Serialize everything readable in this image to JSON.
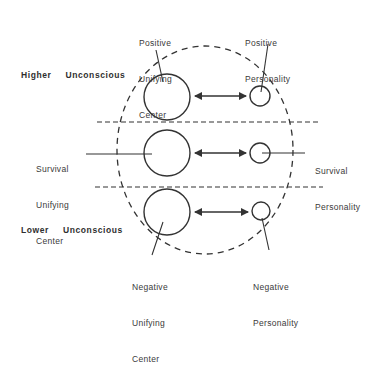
{
  "diagram": {
    "type": "psychological model diagram",
    "regions": {
      "higher": "Higher  Unconscious",
      "lower": "Lower  Unconscious"
    },
    "labels": {
      "positive_center": [
        "Positive",
        "Unifying",
        "Center"
      ],
      "positive_personality": [
        "Positive",
        "Personality"
      ],
      "survival_center": [
        "Survival",
        "Unifying",
        "Center"
      ],
      "survival_personality": [
        "Survival",
        "Personality"
      ],
      "negative_center": [
        "Negative",
        "Unifying",
        "Center"
      ],
      "negative_personality": [
        "Negative",
        "Personality"
      ]
    },
    "colors": {
      "stroke": "#333333",
      "text": "#3a3a3a",
      "background": "#ffffff"
    },
    "rows": [
      {
        "name": "positive",
        "center_circle": {
          "cx": 167,
          "cy": 97,
          "r": 23
        },
        "personality_circle": {
          "cx": 260,
          "cy": 96,
          "r": 10
        }
      },
      {
        "name": "survival",
        "center_circle": {
          "cx": 167,
          "cy": 153,
          "r": 23
        },
        "personality_circle": {
          "cx": 260,
          "cy": 153,
          "r": 10
        }
      },
      {
        "name": "negative",
        "center_circle": {
          "cx": 167,
          "cy": 212,
          "r": 23
        },
        "personality_circle": {
          "cx": 261,
          "cy": 211,
          "r": 9
        }
      }
    ],
    "relationship": "bidirectional arrow between unifying center and personality"
  }
}
